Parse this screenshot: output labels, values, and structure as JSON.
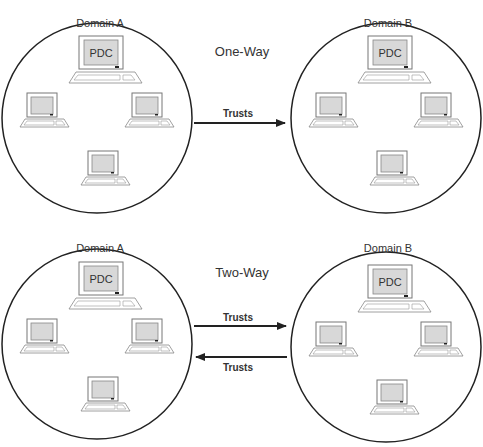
{
  "diagrams": [
    {
      "mode_label": "One-Way",
      "domain_left": {
        "label": "Domain A",
        "server_label": "PDC",
        "workstations": 3
      },
      "domain_right": {
        "label": "Domain B",
        "server_label": "PDC",
        "workstations": 3
      },
      "arrows": [
        {
          "label": "Trusts",
          "direction": "A-to-B"
        }
      ]
    },
    {
      "mode_label": "Two-Way",
      "domain_left": {
        "label": "Domain A",
        "server_label": "PDC",
        "workstations": 3
      },
      "domain_right": {
        "label": "Domain B",
        "server_label": "PDC",
        "workstations": 3
      },
      "arrows": [
        {
          "label": "Trusts",
          "direction": "A-to-B"
        },
        {
          "label": "Trusts",
          "direction": "B-to-A"
        }
      ]
    }
  ],
  "colors": {
    "stroke": "#222222",
    "screen": "#d8d8d8",
    "monitor": "#ffffff",
    "text": "#333333"
  }
}
